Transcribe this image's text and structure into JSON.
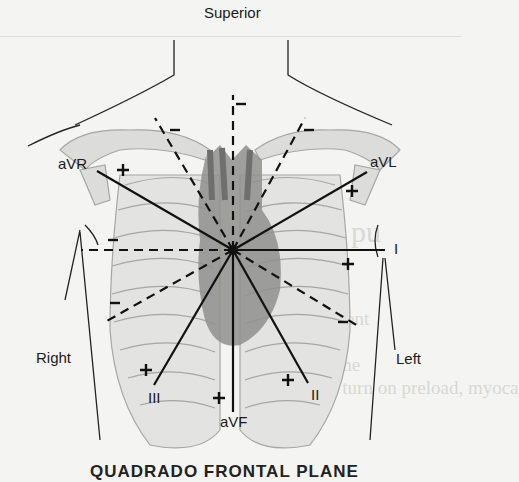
{
  "labels": {
    "superior": "Superior",
    "right": "Right",
    "left": "Left",
    "avr": "aVR",
    "avl": "aVL",
    "lead_i": "I",
    "lead_ii": "II",
    "lead_iii": "III",
    "avf": "aVF"
  },
  "caption": "QUADRADO FRONTAL PLANE",
  "ghost_text": [
    "T a pu",
    "The",
    "prese",
    "com",
    "volum",
    "depende, in turn on preload, myoca"
  ],
  "leads": [
    {
      "name": "I",
      "angle": 0,
      "positive_end": "left"
    },
    {
      "name": "II",
      "angle": 60,
      "positive_end": "inferior-left"
    },
    {
      "name": "III",
      "angle": 120,
      "positive_end": "inferior-right"
    },
    {
      "name": "aVR",
      "angle": -150,
      "positive_end": "superior-right"
    },
    {
      "name": "aVL",
      "angle": -30,
      "positive_end": "superior-left"
    },
    {
      "name": "aVF",
      "angle": 90,
      "positive_end": "inferior"
    }
  ],
  "colors": {
    "background": "#f4f4f2",
    "bone": "#d9d9d7",
    "bone_outline": "#a8a8a6",
    "heart": "#8e8e8c",
    "line": "#111111"
  }
}
